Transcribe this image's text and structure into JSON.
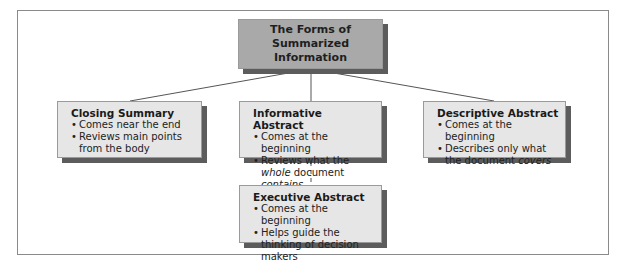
{
  "diagram": {
    "root": {
      "title": "The Forms of\nSummarized Information"
    },
    "nodes": [
      {
        "id": "closing-summary",
        "title": "Closing Summary",
        "bullets": [
          {
            "parts": [
              {
                "text": "Comes near the end",
                "italic": false
              }
            ]
          },
          {
            "parts": [
              {
                "text": "Reviews main points from the body",
                "italic": false
              }
            ]
          }
        ]
      },
      {
        "id": "informative-abstract",
        "title": "Informative Abstract",
        "bullets": [
          {
            "parts": [
              {
                "text": "Comes at the beginning",
                "italic": false
              }
            ]
          },
          {
            "parts": [
              {
                "text": "Reviews what the ",
                "italic": false
              },
              {
                "text": "whole",
                "italic": true
              },
              {
                "text": " document ",
                "italic": false
              },
              {
                "text": "contains",
                "italic": true
              }
            ]
          }
        ]
      },
      {
        "id": "descriptive-abstract",
        "title": "Descriptive Abstract",
        "bullets": [
          {
            "parts": [
              {
                "text": "Comes at the beginning",
                "italic": false
              }
            ]
          },
          {
            "parts": [
              {
                "text": "Describes only what the document ",
                "italic": false
              },
              {
                "text": "covers",
                "italic": true
              }
            ]
          }
        ]
      },
      {
        "id": "executive-abstract",
        "title": "Executive Abstract",
        "bullets": [
          {
            "parts": [
              {
                "text": "Comes at the beginning",
                "italic": false
              }
            ]
          },
          {
            "parts": [
              {
                "text": "Helps guide the thinking of decision makers",
                "italic": false
              }
            ]
          }
        ]
      }
    ],
    "edges": [
      {
        "from": "root",
        "to": "closing-summary",
        "style": "solid"
      },
      {
        "from": "root",
        "to": "informative-abstract",
        "style": "solid"
      },
      {
        "from": "root",
        "to": "descriptive-abstract",
        "style": "solid"
      },
      {
        "from": "informative-abstract",
        "to": "executive-abstract",
        "style": "dashed"
      }
    ],
    "colors": {
      "root_fill": "#a9a9a9",
      "node_fill": "#e6e6e6",
      "shadow": "#5c5c5c",
      "line": "#555555"
    }
  }
}
